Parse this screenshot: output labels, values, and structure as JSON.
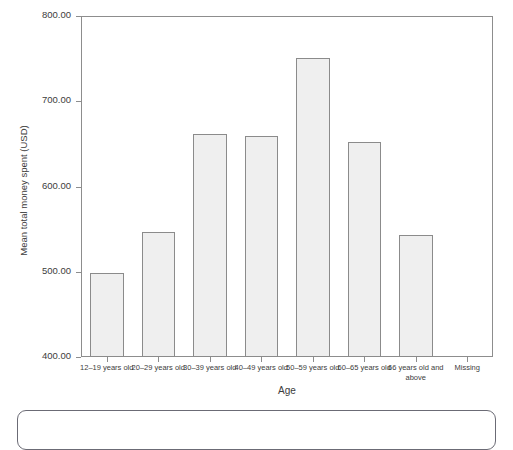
{
  "top_clipped_title": "",
  "chart_data": {
    "type": "bar",
    "title": "",
    "xlabel": "Age",
    "ylabel": "Mean total money spent (USD)",
    "categories": [
      "12–19 years old",
      "20–29 years old",
      "30–39 years old",
      "40–49 years old",
      "50–59 years old",
      "60–65 years old",
      "66 years old and above",
      "Missing"
    ],
    "values": [
      498,
      547,
      662,
      659,
      751,
      652,
      543,
      null
    ],
    "ylim": [
      400,
      800
    ],
    "yticks": [
      400,
      500,
      600,
      700,
      800
    ],
    "ytick_labels": [
      "400.00",
      "500.00",
      "600.00",
      "700.00",
      "800.00"
    ],
    "grid": false,
    "legend": "none",
    "bar_fill_color": "#efefef",
    "bar_border_color": "#8b8b8b",
    "axis_color": "#8d8d8d",
    "text_color": "#3c3c3c"
  },
  "axis": {
    "y_title": "Mean total money spent (USD)",
    "x_title": "Age"
  }
}
